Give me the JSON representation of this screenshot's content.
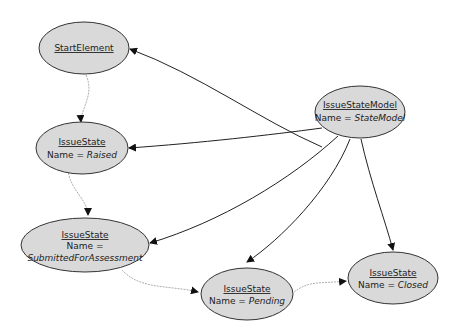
{
  "diagram": {
    "type": "object-diagram",
    "colors": {
      "node_fill": "#d9d9d9",
      "node_stroke": "#333333",
      "edge_solid": "#222222",
      "edge_dashed": "#888888"
    },
    "nodes": [
      {
        "id": "start",
        "title": "StartElement",
        "name_line": "",
        "value": ""
      },
      {
        "id": "model",
        "title": "IssueStateModel",
        "name_line": "Name = ",
        "value": "StateModel"
      },
      {
        "id": "raised",
        "title": "IssueState",
        "name_line": "Name = ",
        "value": "Raised"
      },
      {
        "id": "submitted",
        "title": "IssueState",
        "name_line": "Name =",
        "value": "SubmittedForAssessment"
      },
      {
        "id": "pending",
        "title": "IssueState",
        "name_line": "Name = ",
        "value": "Pending"
      },
      {
        "id": "closed",
        "title": "IssueState",
        "name_line": "Name = ",
        "value": "Closed"
      }
    ],
    "edges": [
      {
        "from": "model",
        "to": "start",
        "style": "solid"
      },
      {
        "from": "model",
        "to": "raised",
        "style": "solid"
      },
      {
        "from": "model",
        "to": "submitted",
        "style": "solid"
      },
      {
        "from": "model",
        "to": "pending",
        "style": "solid"
      },
      {
        "from": "model",
        "to": "closed",
        "style": "solid"
      },
      {
        "from": "start",
        "to": "raised",
        "style": "dashed"
      },
      {
        "from": "raised",
        "to": "submitted",
        "style": "dashed"
      },
      {
        "from": "submitted",
        "to": "pending",
        "style": "dashed"
      },
      {
        "from": "pending",
        "to": "closed",
        "style": "dashed"
      }
    ]
  }
}
